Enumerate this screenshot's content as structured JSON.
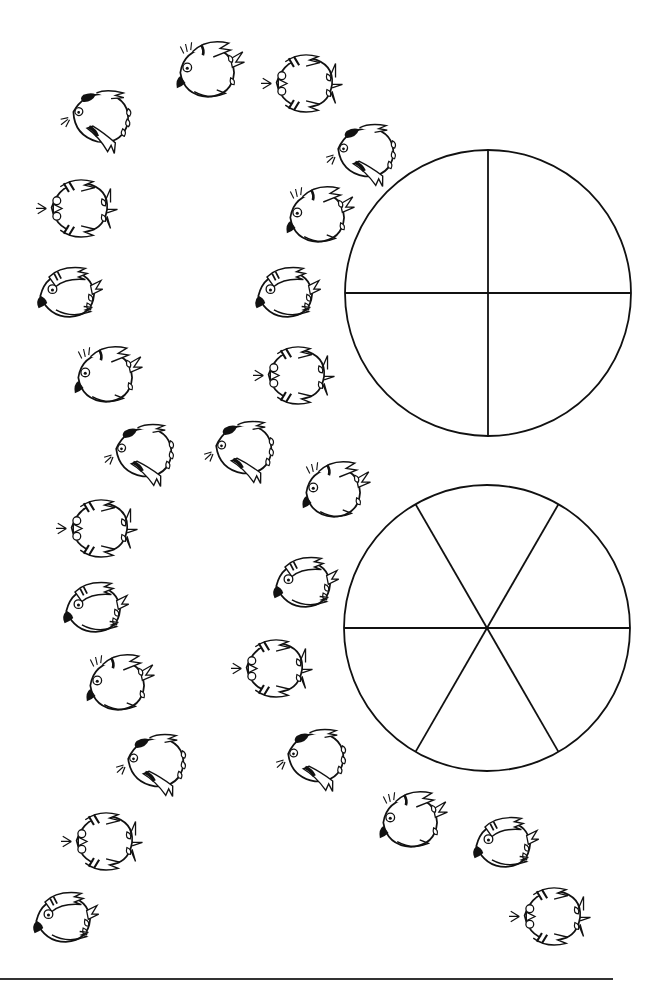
{
  "worksheet": {
    "type": "fraction-counting-worksheet",
    "bird_count": 25,
    "line_color": "#111111",
    "background": "#ffffff"
  },
  "pies": [
    {
      "name": "pie-quarters",
      "slices": 4,
      "cx": 488,
      "cy": 293,
      "r": 143,
      "offset_deg": 0
    },
    {
      "name": "pie-sixths",
      "slices": 6,
      "cx": 487,
      "cy": 628,
      "r": 143,
      "offset_deg": 0
    }
  ],
  "birds": [
    {
      "pose": "patch",
      "x": 95,
      "y": 115,
      "rot": 15
    },
    {
      "pose": "front",
      "x": 75,
      "y": 205,
      "rot": 0
    },
    {
      "pose": "side",
      "x": 62,
      "y": 290,
      "rot": 0
    },
    {
      "pose": "crest",
      "x": 100,
      "y": 375,
      "rot": 0
    },
    {
      "pose": "patch",
      "x": 138,
      "y": 450,
      "rot": 10
    },
    {
      "pose": "front",
      "x": 95,
      "y": 525,
      "rot": 0
    },
    {
      "pose": "side",
      "x": 88,
      "y": 605,
      "rot": 0
    },
    {
      "pose": "crest",
      "x": 112,
      "y": 683,
      "rot": 0
    },
    {
      "pose": "patch",
      "x": 150,
      "y": 760,
      "rot": 10
    },
    {
      "pose": "front",
      "x": 100,
      "y": 838,
      "rot": 0
    },
    {
      "pose": "side",
      "x": 58,
      "y": 915,
      "rot": 0
    },
    {
      "pose": "crest",
      "x": 202,
      "y": 70,
      "rot": 0
    },
    {
      "pose": "front",
      "x": 300,
      "y": 80,
      "rot": 0
    },
    {
      "pose": "patch",
      "x": 360,
      "y": 150,
      "rot": 10
    },
    {
      "pose": "crest",
      "x": 312,
      "y": 215,
      "rot": 0
    },
    {
      "pose": "side",
      "x": 280,
      "y": 290,
      "rot": 0
    },
    {
      "pose": "front",
      "x": 292,
      "y": 372,
      "rot": 0
    },
    {
      "pose": "patch",
      "x": 238,
      "y": 447,
      "rot": 10
    },
    {
      "pose": "crest",
      "x": 328,
      "y": 490,
      "rot": 0
    },
    {
      "pose": "side",
      "x": 298,
      "y": 580,
      "rot": 0
    },
    {
      "pose": "front",
      "x": 270,
      "y": 665,
      "rot": 0
    },
    {
      "pose": "patch",
      "x": 310,
      "y": 755,
      "rot": 10
    },
    {
      "pose": "crest",
      "x": 405,
      "y": 820,
      "rot": 0
    },
    {
      "pose": "side",
      "x": 498,
      "y": 840,
      "rot": 0
    },
    {
      "pose": "front",
      "x": 548,
      "y": 913,
      "rot": 0
    }
  ],
  "footer_rule": {
    "x1": 0,
    "x2": 613,
    "y": 979
  }
}
